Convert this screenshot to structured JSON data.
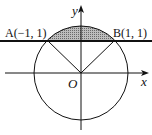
{
  "diagram": {
    "type": "geometry",
    "labels": {
      "y_axis": "y",
      "x_axis": "x",
      "origin": "O",
      "point_a": "A(−1, 1)",
      "point_b": "B(1, 1)"
    },
    "points": {
      "A": [
        -1,
        1
      ],
      "B": [
        1,
        1
      ],
      "O": [
        0,
        0
      ]
    },
    "circle": {
      "center": [
        0,
        0
      ],
      "radius_squared": 2
    },
    "line": "y = 1",
    "colors": {
      "stroke": "#111111",
      "shade": "#999999"
    }
  }
}
